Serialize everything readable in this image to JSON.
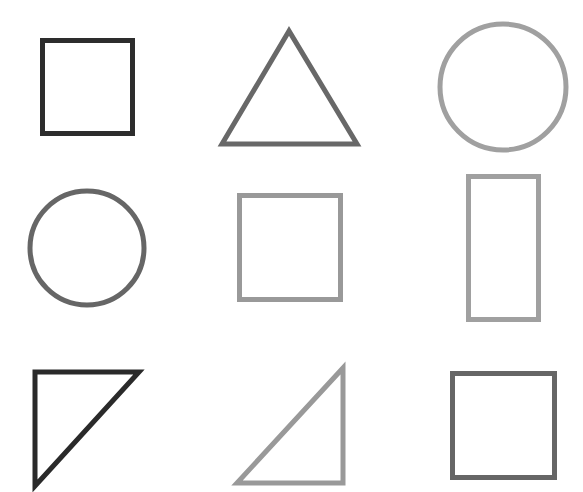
{
  "canvas": {
    "width": 583,
    "height": 492,
    "background": "#ffffff"
  },
  "colors": {
    "dark": "#2d2d2d",
    "mid": "#666666",
    "light": "#a0a0a0"
  },
  "shapes": [
    {
      "id": 1,
      "type": "square",
      "shade": "dark",
      "row": 1,
      "col": 1
    },
    {
      "id": 2,
      "type": "triangle",
      "shade": "mid",
      "row": 1,
      "col": 2
    },
    {
      "id": 3,
      "type": "circle",
      "shade": "light",
      "row": 1,
      "col": 3
    },
    {
      "id": 4,
      "type": "circle",
      "shade": "mid",
      "row": 2,
      "col": 1
    },
    {
      "id": 5,
      "type": "square",
      "shade": "light",
      "row": 2,
      "col": 2
    },
    {
      "id": 6,
      "type": "rectangle",
      "shade": "light",
      "row": 2,
      "col": 3
    },
    {
      "id": 7,
      "type": "right-triangle",
      "shade": "dark",
      "row": 3,
      "col": 1
    },
    {
      "id": 8,
      "type": "right-triangle",
      "shade": "light",
      "row": 3,
      "col": 2
    },
    {
      "id": 9,
      "type": "square",
      "shade": "mid",
      "row": 3,
      "col": 3
    }
  ]
}
